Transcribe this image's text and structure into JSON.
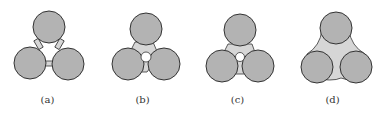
{
  "figure": {
    "colors": {
      "circle_fill": "#b3b3b3",
      "circle_stroke": "#333333",
      "bridge_fill": "#d6d6d6",
      "hole_fill": "#ffffff"
    },
    "panels": [
      {
        "id": "a",
        "label": "(a)",
        "description": "three circles joined by thin bridges, open center"
      },
      {
        "id": "b",
        "label": "(b)",
        "description": "three circles with wider bridges, small circular hole in center"
      },
      {
        "id": "c",
        "label": "(c)",
        "description": "three circles with wide bridges, small circular hole in center"
      },
      {
        "id": "d",
        "label": "(d)",
        "description": "three circles fully joined by filled concave region, no hole"
      }
    ]
  }
}
